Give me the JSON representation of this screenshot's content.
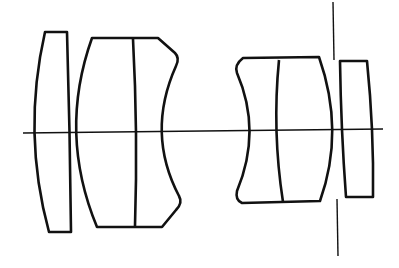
{
  "diagram": {
    "type": "optical-lens-cross-section",
    "stroke_color": "#111111",
    "background": "#ffffff",
    "groups": [
      {
        "name": "front-element",
        "elements": 1
      },
      {
        "name": "front-cemented-doublet",
        "elements": 2
      },
      {
        "name": "rear-cemented-doublet",
        "elements": 2
      },
      {
        "name": "rear-element",
        "elements": 1
      }
    ],
    "total_elements": 6,
    "total_groups": 4,
    "has_optical_axis": true,
    "has_aperture_stop": true
  }
}
